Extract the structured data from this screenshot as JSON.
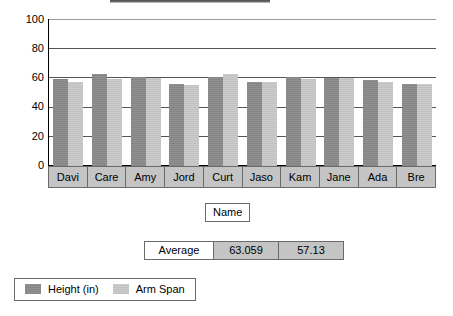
{
  "title_bar": {
    "present": true,
    "note": ""
  },
  "chart_data": {
    "type": "bar",
    "title": "",
    "subtitle": "",
    "xlabel": "Name",
    "ylabel": "",
    "ylim": [
      0,
      100
    ],
    "yticks": [
      100,
      80,
      60,
      40,
      20,
      0
    ],
    "grid": true,
    "legend_position": "bottom-left",
    "categories": [
      "Davi",
      "Care",
      "Amy",
      "Jord",
      "Curt",
      "Jaso",
      "Kam",
      "Jane",
      "Ada",
      "Bre"
    ],
    "series": [
      {
        "name": "Height (in)",
        "color": "#8c8c8c",
        "values": [
          62.5,
          66,
          64,
          59,
          64,
          60.5,
          64,
          63,
          61.5,
          59
        ]
      },
      {
        "name": "Arm Span",
        "color": "#c9c9c9",
        "values": [
          60.5,
          62.5,
          63,
          58,
          65.5,
          60.5,
          62,
          63,
          60.5,
          59
        ]
      }
    ]
  },
  "axis_title_box": {
    "label": "Name"
  },
  "average_table": {
    "label": "Average",
    "height_average": "63.059",
    "arm_span_average": "57.13"
  },
  "legend": {
    "items": [
      {
        "label": "Height (in)",
        "color": "#8c8c8c"
      },
      {
        "label": "Arm Span",
        "color": "#c9c9c9"
      }
    ]
  },
  "colors": {
    "height_bar": "#8c8c8c",
    "arm_span_bar": "#c9c9c9",
    "band_background": "#c4c4c4",
    "border": "#6b6b6b",
    "gridline": "#555555"
  }
}
